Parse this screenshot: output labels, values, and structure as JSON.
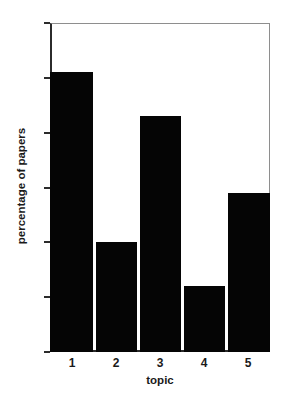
{
  "chart_data": {
    "type": "bar",
    "title": "",
    "subtitle": "",
    "categories": [
      "1",
      "2",
      "3",
      "4",
      "5"
    ],
    "values": [
      51,
      20,
      43,
      12,
      29
    ],
    "series": [
      {
        "name": "percentage of papers",
        "values": [
          51,
          20,
          43,
          12,
          29
        ]
      }
    ],
    "xlabel": "topic",
    "ylabel": "percentage of papers",
    "xlim": [
      0.5,
      5.5
    ],
    "ylim": [
      0,
      60
    ],
    "yticks": [
      0,
      10,
      20,
      30,
      40,
      50,
      60
    ],
    "ytick_labels": [
      "0",
      "10",
      "20",
      "30",
      "40",
      "50",
      "60"
    ],
    "xticks": [
      1,
      2,
      3,
      4,
      5
    ],
    "xtick_labels": [
      "1",
      "2",
      "3",
      "4",
      "5"
    ],
    "grid": false,
    "legend": false,
    "legend_position": "none",
    "bar_color": "#050505",
    "axis_color": "#2b2b2b",
    "frame_color": "#8e8e8e",
    "background_color": "#ffffff",
    "annotations": []
  }
}
